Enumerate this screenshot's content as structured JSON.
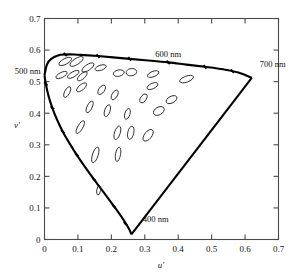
{
  "figure": {
    "title": "",
    "background_color": "#ffffff",
    "frame_color": "#4a4a4a",
    "locus_color": "#000000",
    "ellipse_color": "#222222"
  },
  "axes": {
    "x_title": "u′",
    "y_title": "v′",
    "x_ticks": [
      "0",
      "0.1",
      "0.2",
      "0.3",
      "0.4",
      "0.5",
      "0.6",
      "0.7"
    ],
    "y_ticks": [
      "0",
      "0.1",
      "0.2",
      "0.3",
      "0.4",
      "0.5",
      "0.6",
      "0.7"
    ],
    "xlim": [
      0,
      0.7
    ],
    "ylim": [
      0,
      0.7
    ],
    "grid": false
  },
  "annotations": [
    {
      "name": "label-500nm",
      "text": "500 nm",
      "u": 0.0,
      "v": 0.525,
      "anchor": "end"
    },
    {
      "name": "label-600nm",
      "text": "600 nm",
      "u": 0.37,
      "v": 0.578,
      "anchor": "middle"
    },
    {
      "name": "label-700nm",
      "text": "700 nm",
      "u": 0.635,
      "v": 0.545,
      "anchor": "start"
    },
    {
      "name": "label-400nm",
      "text": "400 nm",
      "u": 0.285,
      "v": 0.055,
      "anchor": "start"
    }
  ],
  "chart_data": {
    "type": "scatter",
    "xlabel": "u′",
    "ylabel": "v′",
    "xlim": [
      0,
      0.7
    ],
    "ylim": [
      0,
      0.7
    ],
    "grid": false,
    "legend": null,
    "spectral_locus": {
      "name": "spectral-locus-boundary",
      "description": "Closed horseshoe boundary of visible chromaticities in u′v′ space, with purple line closing from 400 nm vertex to 700 nm vertex.",
      "points_uv": [
        [
          0.0,
          0.52
        ],
        [
          0.0075,
          0.555
        ],
        [
          0.02,
          0.572
        ],
        [
          0.04,
          0.583
        ],
        [
          0.062,
          0.586
        ],
        [
          0.09,
          0.586
        ],
        [
          0.12,
          0.584
        ],
        [
          0.16,
          0.581
        ],
        [
          0.205,
          0.577
        ],
        [
          0.255,
          0.572
        ],
        [
          0.31,
          0.567
        ],
        [
          0.37,
          0.561
        ],
        [
          0.425,
          0.554
        ],
        [
          0.48,
          0.547
        ],
        [
          0.535,
          0.539
        ],
        [
          0.58,
          0.529
        ],
        [
          0.62,
          0.512
        ]
      ],
      "lower_arc_uv": [
        [
          0.0,
          0.52
        ],
        [
          0.0045,
          0.49
        ],
        [
          0.012,
          0.455
        ],
        [
          0.023,
          0.418
        ],
        [
          0.037,
          0.381
        ],
        [
          0.054,
          0.343
        ],
        [
          0.074,
          0.306
        ],
        [
          0.096,
          0.269
        ],
        [
          0.121,
          0.23
        ],
        [
          0.149,
          0.189
        ],
        [
          0.18,
          0.145
        ],
        [
          0.208,
          0.105
        ],
        [
          0.234,
          0.066
        ],
        [
          0.253,
          0.033
        ],
        [
          0.26,
          0.016
        ]
      ],
      "purple_line_uv": [
        [
          0.26,
          0.016
        ],
        [
          0.62,
          0.512
        ]
      ]
    },
    "locus_tick_points_uv": [
      [
        0.062,
        0.586
      ],
      [
        0.16,
        0.581
      ],
      [
        0.255,
        0.572
      ],
      [
        0.37,
        0.561
      ],
      [
        0.48,
        0.547
      ],
      [
        0.562,
        0.533
      ],
      [
        0.004,
        0.493
      ],
      [
        0.0235,
        0.417
      ],
      [
        0.0545,
        0.342
      ],
      [
        0.0965,
        0.268
      ],
      [
        0.1485,
        0.19
      ],
      [
        0.208,
        0.105
      ],
      [
        0.242,
        0.05
      ]
    ],
    "ellipses": [
      {
        "u": 0.062,
        "v": 0.564,
        "rx": 0.021,
        "ry": 0.009,
        "angle": -28
      },
      {
        "u": 0.096,
        "v": 0.564,
        "rx": 0.023,
        "ry": 0.0095,
        "angle": -33
      },
      {
        "u": 0.13,
        "v": 0.545,
        "rx": 0.021,
        "ry": 0.009,
        "angle": -34
      },
      {
        "u": 0.051,
        "v": 0.521,
        "rx": 0.0185,
        "ry": 0.008,
        "angle": -27
      },
      {
        "u": 0.086,
        "v": 0.523,
        "rx": 0.0195,
        "ry": 0.008,
        "angle": -30
      },
      {
        "u": 0.113,
        "v": 0.517,
        "rx": 0.0185,
        "ry": 0.0082,
        "angle": -42
      },
      {
        "u": 0.168,
        "v": 0.544,
        "rx": 0.0175,
        "ry": 0.008,
        "angle": -18
      },
      {
        "u": 0.222,
        "v": 0.527,
        "rx": 0.0165,
        "ry": 0.01,
        "angle": -12
      },
      {
        "u": 0.26,
        "v": 0.53,
        "rx": 0.016,
        "ry": 0.0115,
        "angle": -8
      },
      {
        "u": 0.325,
        "v": 0.524,
        "rx": 0.018,
        "ry": 0.0085,
        "angle": -22
      },
      {
        "u": 0.425,
        "v": 0.508,
        "rx": 0.0215,
        "ry": 0.0095,
        "angle": -20
      },
      {
        "u": 0.323,
        "v": 0.486,
        "rx": 0.0175,
        "ry": 0.0085,
        "angle": -25
      },
      {
        "u": 0.068,
        "v": 0.467,
        "rx": 0.0175,
        "ry": 0.008,
        "angle": -62
      },
      {
        "u": 0.111,
        "v": 0.482,
        "rx": 0.0185,
        "ry": 0.0085,
        "angle": -40
      },
      {
        "u": 0.171,
        "v": 0.474,
        "rx": 0.016,
        "ry": 0.009,
        "angle": -55
      },
      {
        "u": 0.21,
        "v": 0.458,
        "rx": 0.016,
        "ry": 0.0085,
        "angle": -60
      },
      {
        "u": 0.296,
        "v": 0.447,
        "rx": 0.015,
        "ry": 0.009,
        "angle": -58
      },
      {
        "u": 0.38,
        "v": 0.443,
        "rx": 0.0175,
        "ry": 0.0105,
        "angle": -28
      },
      {
        "u": 0.342,
        "v": 0.407,
        "rx": 0.0175,
        "ry": 0.012,
        "angle": -30
      },
      {
        "u": 0.135,
        "v": 0.42,
        "rx": 0.019,
        "ry": 0.008,
        "angle": -64
      },
      {
        "u": 0.188,
        "v": 0.408,
        "rx": 0.0185,
        "ry": 0.0085,
        "angle": -72
      },
      {
        "u": 0.248,
        "v": 0.398,
        "rx": 0.0165,
        "ry": 0.008,
        "angle": -72
      },
      {
        "u": 0.107,
        "v": 0.356,
        "rx": 0.0215,
        "ry": 0.008,
        "angle": -60
      },
      {
        "u": 0.218,
        "v": 0.338,
        "rx": 0.021,
        "ry": 0.009,
        "angle": -72
      },
      {
        "u": 0.258,
        "v": 0.338,
        "rx": 0.02,
        "ry": 0.0095,
        "angle": -78
      },
      {
        "u": 0.31,
        "v": 0.33,
        "rx": 0.0205,
        "ry": 0.0115,
        "angle": -52
      },
      {
        "u": 0.152,
        "v": 0.268,
        "rx": 0.0245,
        "ry": 0.009,
        "angle": -72
      },
      {
        "u": 0.22,
        "v": 0.27,
        "rx": 0.0215,
        "ry": 0.008,
        "angle": -80
      },
      {
        "u": 0.162,
        "v": 0.156,
        "rx": 0.014,
        "ry": 0.006,
        "angle": -82
      }
    ]
  }
}
